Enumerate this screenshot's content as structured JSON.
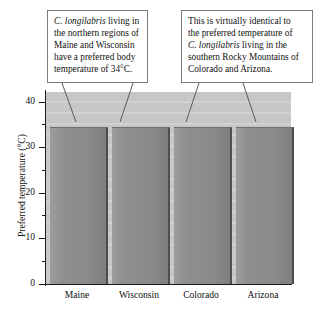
{
  "figure": {
    "kind": "bar-chart-with-annotations"
  },
  "chart_data": {
    "type": "bar",
    "title": "",
    "xlabel": "",
    "ylabel": "Preferred temperature (°C)",
    "categories": [
      "Maine",
      "Wisconsin",
      "Colorado",
      "Arizona"
    ],
    "values": [
      35,
      35,
      35,
      35
    ],
    "ylim": [
      0,
      43
    ],
    "yticks_major": [
      0,
      10,
      20,
      30,
      40
    ],
    "yticks_minor": [
      5,
      15,
      25,
      35
    ],
    "ytick_labels": [
      "0",
      "10",
      "20",
      "30",
      "40"
    ],
    "grid": false,
    "legend": "none",
    "series": [
      {
        "name": "Preferred body temperature",
        "values": [
          35,
          35,
          35,
          35
        ]
      }
    ],
    "annotations": [
      {
        "id": "callout-left",
        "text": "C. longilabris living in the northern regions of Maine and Wisconsin have a preferred body temperature of 34°C.",
        "lines": [
          {
            "plain_pre": "",
            "italic": "C. longilabris",
            "plain_post": " living in"
          },
          {
            "plain_pre": "the northern regions of",
            "italic": "",
            "plain_post": ""
          },
          {
            "plain_pre": "Maine and Wisconsin",
            "italic": "",
            "plain_post": ""
          },
          {
            "plain_pre": "have a preferred body",
            "italic": "",
            "plain_post": ""
          },
          {
            "plain_pre": "temperature of 34°C.",
            "italic": "",
            "plain_post": ""
          }
        ],
        "points_to": [
          "Maine",
          "Wisconsin"
        ]
      },
      {
        "id": "callout-right",
        "text": "This is virtually identical to the preferred temperature of C. longilabris living in the southern Rocky Mountains of Colorado and Arizona.",
        "lines": [
          {
            "plain_pre": "This is virtually identical to",
            "italic": "",
            "plain_post": ""
          },
          {
            "plain_pre": "the preferred temperature of",
            "italic": "",
            "plain_post": ""
          },
          {
            "plain_pre": "",
            "italic": "C. longilabris",
            "plain_post": " living in the"
          },
          {
            "plain_pre": "southern Rocky Mountains of",
            "italic": "",
            "plain_post": ""
          },
          {
            "plain_pre": "Colorado and Arizona.",
            "italic": "",
            "plain_post": ""
          }
        ],
        "points_to": [
          "Colorado",
          "Arizona"
        ]
      }
    ],
    "colors": {
      "bar_fill": "#8f8f8f",
      "bar_edge": "#4e4e4e",
      "plot_background": "#c9c9c9",
      "axis": "#1a1a1a",
      "text": "#111111",
      "callout_border": "#7a7a7a",
      "callout_background": "#ffffff"
    }
  }
}
